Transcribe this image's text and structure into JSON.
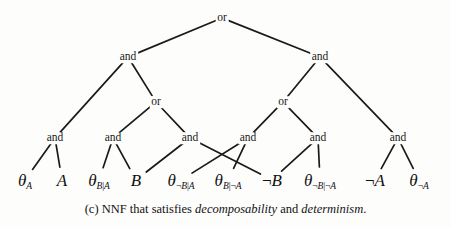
{
  "figure": {
    "caption_prefix": "(c) NNF that satisfies ",
    "caption_term1": "decomposability",
    "caption_mid": " and ",
    "caption_term2": "determinism",
    "caption_suffix": ".",
    "line_color": "#1a1a1a",
    "text_color": "#111111",
    "background": "#fdfdfc"
  },
  "tree": {
    "nodes": [
      {
        "id": "n0",
        "label": "or",
        "x": 222,
        "y": 18
      },
      {
        "id": "n1",
        "label": "and",
        "x": 128,
        "y": 57
      },
      {
        "id": "n2",
        "label": "and",
        "x": 320,
        "y": 57
      },
      {
        "id": "n3",
        "label": "or",
        "x": 156,
        "y": 102
      },
      {
        "id": "n4",
        "label": "or",
        "x": 283,
        "y": 102
      },
      {
        "id": "n5",
        "label": "and",
        "x": 55,
        "y": 138
      },
      {
        "id": "n6",
        "label": "and",
        "x": 113,
        "y": 138
      },
      {
        "id": "n7",
        "label": "and",
        "x": 190,
        "y": 138
      },
      {
        "id": "n8",
        "label": "and",
        "x": 248,
        "y": 138
      },
      {
        "id": "n9",
        "label": "and",
        "x": 318,
        "y": 138
      },
      {
        "id": "n10",
        "label": "and",
        "x": 398,
        "y": 138
      }
    ],
    "leaves": [
      {
        "id": "l0",
        "x": 25,
        "y": 180,
        "base": "θ",
        "sub": "A"
      },
      {
        "id": "l1",
        "x": 62,
        "y": 180,
        "base": "A",
        "sub": ""
      },
      {
        "id": "l2",
        "x": 99,
        "y": 180,
        "base": "θ",
        "sub": "B|A"
      },
      {
        "id": "l3",
        "x": 136,
        "y": 180,
        "base": "B",
        "sub": ""
      },
      {
        "id": "l4",
        "x": 181,
        "y": 180,
        "base": "θ",
        "sub": "¬B|A"
      },
      {
        "id": "l5",
        "x": 228,
        "y": 180,
        "base": "θ",
        "sub": "B|¬A"
      },
      {
        "id": "l6",
        "x": 272,
        "y": 180,
        "base": "¬B",
        "sub": ""
      },
      {
        "id": "l7",
        "x": 320,
        "y": 180,
        "base": "θ",
        "sub": "¬B|¬A"
      },
      {
        "id": "l8",
        "x": 375,
        "y": 180,
        "base": "¬A",
        "sub": ""
      },
      {
        "id": "l9",
        "x": 419,
        "y": 180,
        "base": "θ",
        "sub": "¬A"
      }
    ],
    "edges": [
      {
        "from": "n0",
        "to": "n1"
      },
      {
        "from": "n0",
        "to": "n2"
      },
      {
        "from": "n1",
        "to": "n5"
      },
      {
        "from": "n1",
        "to": "n3"
      },
      {
        "from": "n2",
        "to": "n4"
      },
      {
        "from": "n2",
        "to": "n10"
      },
      {
        "from": "n3",
        "to": "n6"
      },
      {
        "from": "n3",
        "to": "n7"
      },
      {
        "from": "n4",
        "to": "n8"
      },
      {
        "from": "n4",
        "to": "n9"
      },
      {
        "from": "n5",
        "to": "l0"
      },
      {
        "from": "n5",
        "to": "l1"
      },
      {
        "from": "n6",
        "to": "l2"
      },
      {
        "from": "n6",
        "to": "l3"
      },
      {
        "from": "n7",
        "to": "l3"
      },
      {
        "from": "n7",
        "to": "l6"
      },
      {
        "from": "n8",
        "to": "l4"
      },
      {
        "from": "n8",
        "to": "l5"
      },
      {
        "from": "n9",
        "to": "l6"
      },
      {
        "from": "n9",
        "to": "l7"
      },
      {
        "from": "n10",
        "to": "l8"
      },
      {
        "from": "n10",
        "to": "l9"
      }
    ]
  }
}
